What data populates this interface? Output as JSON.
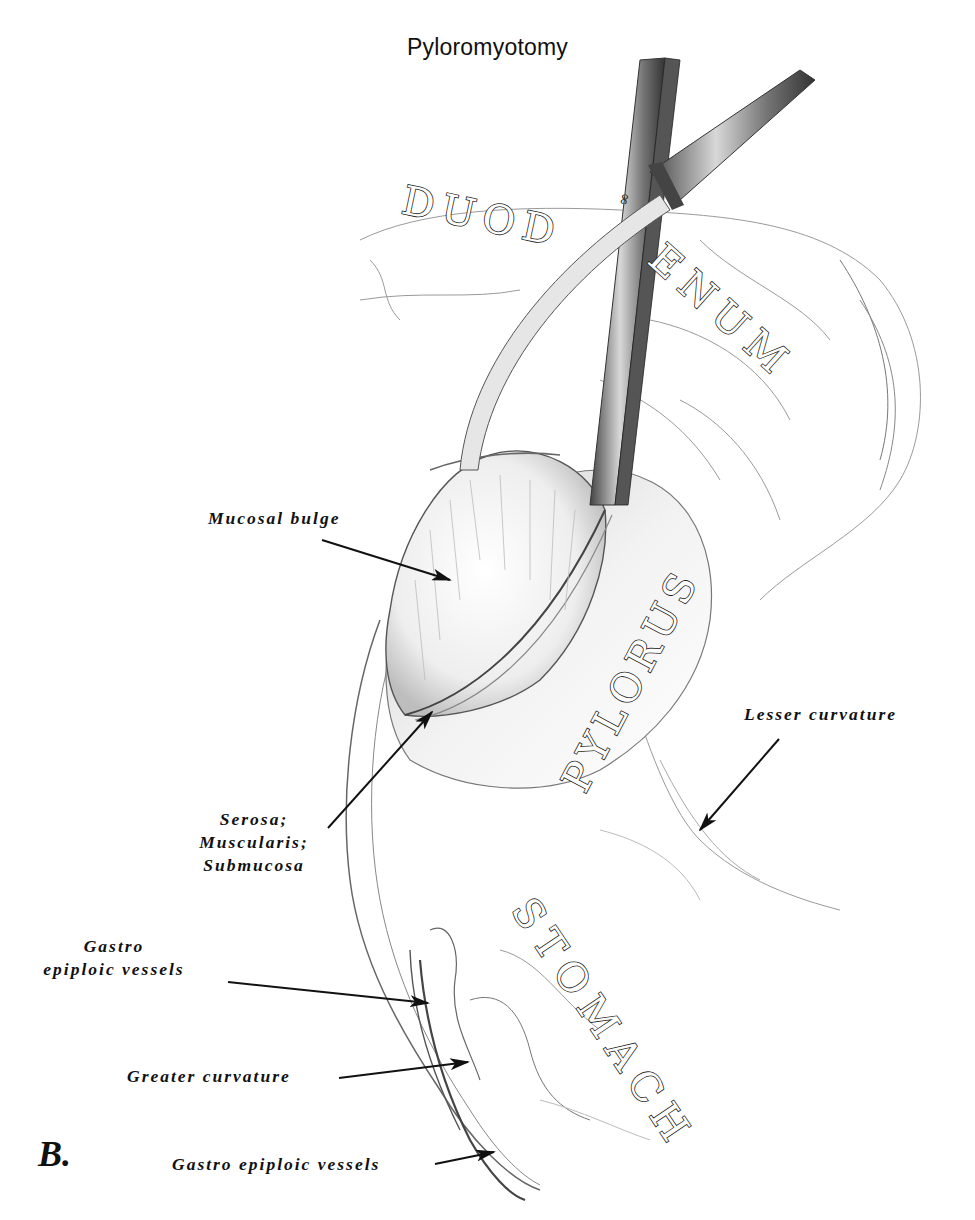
{
  "figure": {
    "title": "Pyloromyotomy",
    "panel_letter": "B.",
    "organ_labels": {
      "duodenum_part1": "DUOD",
      "duodenum_part2": "ENUM",
      "pylorus": "PYLORUS",
      "stomach": "STOMACH"
    },
    "callouts": [
      {
        "id": "mucosal-bulge",
        "lines": [
          "Mucosal bulge"
        ]
      },
      {
        "id": "serosa-muscularis-submucosa",
        "lines": [
          "Serosa;",
          "Muscularis;",
          "Submucosa"
        ]
      },
      {
        "id": "lesser-curvature",
        "lines": [
          "Lesser curvature"
        ]
      },
      {
        "id": "gastro-epiploic-vessels-upper",
        "lines": [
          "Gastro",
          "epiploic vessels"
        ]
      },
      {
        "id": "greater-curvature",
        "lines": [
          "Greater curvature"
        ]
      },
      {
        "id": "gastro-epiploic-vessels-lower",
        "lines": [
          "Gastro epiploic vessels"
        ]
      }
    ],
    "colors": {
      "ink": "#111111",
      "sketch": "#555555",
      "sketch_light": "#9a9a9a",
      "background": "#ffffff"
    }
  }
}
